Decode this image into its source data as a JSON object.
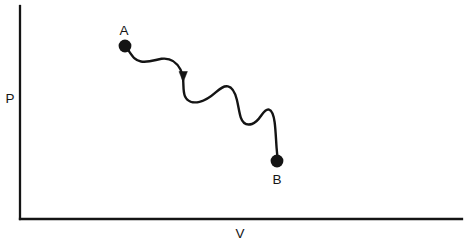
{
  "figure": {
    "background_color": "#ffffff",
    "ink_color": "#141414"
  },
  "axes": {
    "y_axis": {
      "label": "P",
      "name": "pressure",
      "x": 20,
      "y_top": 6,
      "y_bottom": 219,
      "label_x": 10,
      "label_y": 103
    },
    "x_axis": {
      "label": "V",
      "name": "volume",
      "y": 219,
      "x_left": 20,
      "x_right": 462,
      "label_x": 240,
      "label_y": 238
    },
    "ticks": [],
    "gridlines": false
  },
  "states": [
    {
      "id": "A",
      "label": "A",
      "role": "start-state",
      "dot_x": 125,
      "dot_y": 46,
      "dot_radius": 6.4,
      "label_x": 124,
      "label_y": 35
    },
    {
      "id": "B",
      "label": "B",
      "role": "end-state",
      "dot_x": 277,
      "dot_y": 161,
      "dot_radius": 6.4,
      "label_x": 277,
      "label_y": 184
    }
  ],
  "process_path": {
    "name": "irregular-process-curve",
    "direction": "A-to-B",
    "stroke_width": 2.4,
    "d": "M 128.5 50.5 C 133 57 135 60.5 141 61.5 C 149 62.8 156 59.5 161.5 58.8 C 170 57.7 176.5 62 180.5 69.5 C 182.3 73 183 77 183.2 80.5 C 183.6 87 183.2 91.5 184.8 95.8 C 187 101.6 193 103.2 199.5 101.8 C 206 100.4 211.5 96.2 216 92.2 C 220.5 88.2 223.8 85.6 228 86.4 C 232.5 87.3 235 92.5 236.8 99.5 C 238.4 105.8 239.2 113 240.8 117.6 C 242.8 123.3 247 125.6 252 124 C 256.5 122.6 259.5 118 261.6 115 C 264.4 111 266.4 108.8 269 109.6 C 272 110.5 273.6 115 274.6 122 C 275.6 129 276 140 276.6 148 C 277 152.5 277.2 154.6 277.3 155.5"
  },
  "arrow": {
    "name": "flow-direction-arrow",
    "tip_x": 183.2,
    "tip_y": 81.5,
    "half_width": 4.2,
    "height": 10.5,
    "points": "179.0,71.5 187.4,71.5 183.2,82.0"
  }
}
